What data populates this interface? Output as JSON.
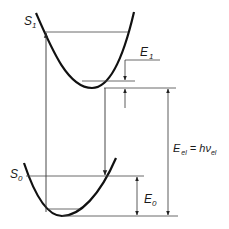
{
  "diagram": {
    "type": "energy-level-diagram",
    "colors": {
      "curve": "#111111",
      "line": "#333333",
      "background": "#ffffff"
    },
    "states": [
      {
        "name": "S",
        "subscript": "1",
        "role": "excited-state"
      },
      {
        "name": "S",
        "subscript": "0",
        "role": "ground-state"
      }
    ],
    "labels": {
      "e1": {
        "main": "E",
        "sub": "1"
      },
      "e0": {
        "main": "E",
        "sub": "0"
      },
      "eel": {
        "main": "E",
        "sub": "el",
        "eq": " = hν",
        "eq_sub": "el"
      }
    }
  }
}
